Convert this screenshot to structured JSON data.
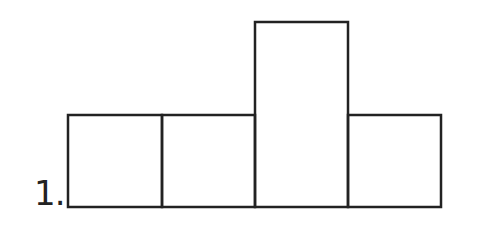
{
  "problem": {
    "number_label": "1.",
    "figure": "polyomino-tetromino",
    "stroke_color": "#222222",
    "squares": [
      {
        "col": 0,
        "row": 0
      },
      {
        "col": 1,
        "row": 0
      },
      {
        "col": 2,
        "row": 0,
        "height_units": 2
      },
      {
        "col": 3,
        "row": 0
      }
    ]
  }
}
